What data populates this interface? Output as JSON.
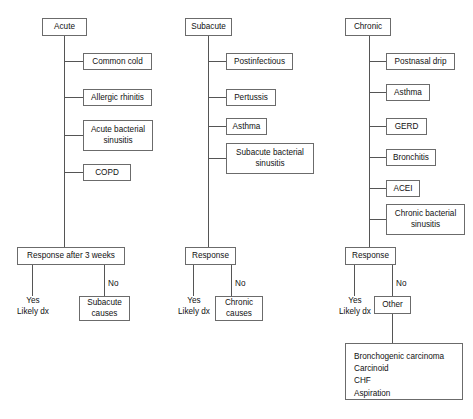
{
  "diagram": {
    "type": "flowchart",
    "background_color": "#ffffff",
    "box_border_color": "#6b6b6b",
    "connector_color": "#555555",
    "text_color": "#111111"
  },
  "columns": [
    {
      "id": "acute",
      "root_label": "Acute",
      "causes": [
        "Common cold",
        "Allergic rhinitis",
        "Acute bacterial sinusitis",
        "COPD"
      ],
      "decision_label": "Response after 3 weeks",
      "yes_branch": {
        "edge_label": "Yes",
        "outcome_line1": "Likely dx"
      },
      "no_branch": {
        "edge_label": "No",
        "outcome_label": "Subacute causes"
      }
    },
    {
      "id": "subacute",
      "root_label": "Subacute",
      "causes": [
        "Postinfectious",
        "Pertussis",
        "Asthma",
        "Subacute bacterial sinusitis"
      ],
      "decision_label": "Response",
      "yes_branch": {
        "edge_label": "Yes",
        "outcome_line1": "Likely dx"
      },
      "no_branch": {
        "edge_label": "No",
        "outcome_label": "Chronic causes"
      }
    },
    {
      "id": "chronic",
      "root_label": "Chronic",
      "causes": [
        "Postnasal drip",
        "Asthma",
        "GERD",
        "Bronchitis",
        "ACEI",
        "Chronic bacterial sinusitis"
      ],
      "decision_label": "Response",
      "yes_branch": {
        "edge_label": "Yes",
        "outcome_line1": "Likely dx"
      },
      "no_branch": {
        "edge_label": "No",
        "outcome_label": "Other",
        "other_list": [
          "Bronchogenic carcinoma",
          "Carcinoid",
          "CHF",
          "Aspiration"
        ]
      }
    }
  ]
}
